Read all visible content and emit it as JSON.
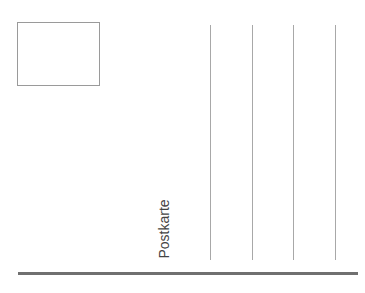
{
  "postcard": {
    "label": "Postkarte",
    "stamp_box": {
      "present": true
    },
    "address_lines": 4,
    "colors": {
      "lines": "#a8a8a8",
      "rule": "#707070",
      "text": "#444444"
    }
  }
}
